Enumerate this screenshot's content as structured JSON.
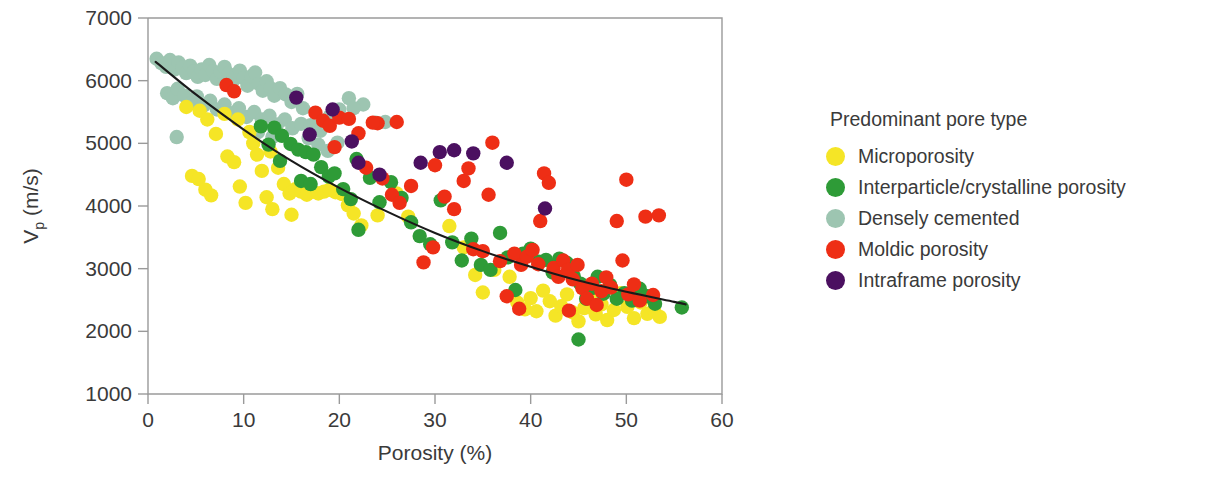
{
  "chart_data": {
    "type": "scatter",
    "title": "",
    "xlabel": "Porosity (%)",
    "ylabel": "Vp (m/s)",
    "ylabel_base": "V",
    "ylabel_sub": "p",
    "ylabel_unit": " (m/s)",
    "xlim": [
      0,
      60
    ],
    "ylim": [
      1000,
      7000
    ],
    "xticks": [
      0,
      10,
      20,
      30,
      40,
      50,
      60
    ],
    "yticks": [
      1000,
      2000,
      3000,
      4000,
      5000,
      6000,
      7000
    ],
    "xtick_labels": [
      "0",
      "10",
      "20",
      "30",
      "40",
      "50",
      "60"
    ],
    "ytick_labels": [
      "1000",
      "2000",
      "3000",
      "4000",
      "5000",
      "6000",
      "7000"
    ],
    "grid": false,
    "legend_position": "right",
    "legend_title": "Predominant pore type",
    "marker_radius": 7.2,
    "series": [
      {
        "name": "Microporosity",
        "color": "#F5E526",
        "points": [
          [
            4.0,
            5580
          ],
          [
            5.4,
            5520
          ],
          [
            6.2,
            5380
          ],
          [
            7.1,
            5150
          ],
          [
            4.6,
            4480
          ],
          [
            5.3,
            4430
          ],
          [
            6.0,
            4260
          ],
          [
            6.6,
            4170
          ],
          [
            8.3,
            4790
          ],
          [
            9.0,
            4700
          ],
          [
            9.6,
            4310
          ],
          [
            10.2,
            4050
          ],
          [
            11.0,
            5000
          ],
          [
            11.4,
            4820
          ],
          [
            11.9,
            4560
          ],
          [
            12.4,
            4140
          ],
          [
            13.0,
            3950
          ],
          [
            13.6,
            4610
          ],
          [
            14.2,
            4350
          ],
          [
            14.8,
            4200
          ],
          [
            15.4,
            4270
          ],
          [
            16.0,
            4230
          ],
          [
            16.6,
            4180
          ],
          [
            17.2,
            4230
          ],
          [
            17.8,
            4200
          ],
          [
            18.4,
            4230
          ],
          [
            19.0,
            4260
          ],
          [
            19.6,
            4220
          ],
          [
            20.3,
            4190
          ],
          [
            20.9,
            4010
          ],
          [
            21.5,
            3880
          ],
          [
            15.0,
            3860
          ],
          [
            12.8,
            4870
          ],
          [
            10.6,
            5180
          ],
          [
            9.4,
            5380
          ],
          [
            8.0,
            5470
          ],
          [
            22.3,
            3690
          ],
          [
            24.0,
            3850
          ],
          [
            26.0,
            4200
          ],
          [
            27.2,
            3830
          ],
          [
            31.5,
            3680
          ],
          [
            33.0,
            3340
          ],
          [
            36.2,
            2980
          ],
          [
            37.8,
            2870
          ],
          [
            38.6,
            2460
          ],
          [
            39.4,
            2350
          ],
          [
            40.0,
            2530
          ],
          [
            40.6,
            2320
          ],
          [
            41.3,
            2650
          ],
          [
            42.0,
            2480
          ],
          [
            42.6,
            2250
          ],
          [
            43.2,
            2400
          ],
          [
            43.8,
            2590
          ],
          [
            44.4,
            2300
          ],
          [
            45.0,
            2160
          ],
          [
            45.6,
            2370
          ],
          [
            46.2,
            2520
          ],
          [
            46.8,
            2270
          ],
          [
            47.4,
            2430
          ],
          [
            48.0,
            2180
          ],
          [
            48.7,
            2340
          ],
          [
            49.4,
            2610
          ],
          [
            50.1,
            2390
          ],
          [
            50.8,
            2210
          ],
          [
            51.5,
            2460
          ],
          [
            52.2,
            2280
          ],
          [
            52.9,
            2340
          ],
          [
            53.5,
            2230
          ],
          [
            35.0,
            2620
          ],
          [
            34.2,
            2900
          ]
        ]
      },
      {
        "name": "Interparticle/crystalline porosity",
        "color": "#2E9B37",
        "points": [
          [
            13.2,
            5250
          ],
          [
            14.0,
            5120
          ],
          [
            14.9,
            4990
          ],
          [
            15.7,
            4900
          ],
          [
            16.5,
            4860
          ],
          [
            17.3,
            4820
          ],
          [
            18.1,
            4620
          ],
          [
            18.9,
            4470
          ],
          [
            12.6,
            4980
          ],
          [
            13.8,
            4720
          ],
          [
            16.0,
            4400
          ],
          [
            17.0,
            4350
          ],
          [
            19.5,
            4520
          ],
          [
            20.4,
            4270
          ],
          [
            21.2,
            4110
          ],
          [
            22.0,
            3620
          ],
          [
            24.2,
            4060
          ],
          [
            25.4,
            4380
          ],
          [
            26.5,
            4130
          ],
          [
            27.5,
            3740
          ],
          [
            28.4,
            3520
          ],
          [
            29.5,
            3390
          ],
          [
            30.6,
            4090
          ],
          [
            31.8,
            3420
          ],
          [
            32.8,
            3130
          ],
          [
            33.8,
            3480
          ],
          [
            34.8,
            3060
          ],
          [
            35.8,
            2980
          ],
          [
            36.8,
            3570
          ],
          [
            37.6,
            3180
          ],
          [
            38.4,
            2660
          ],
          [
            39.2,
            3240
          ],
          [
            40.0,
            3320
          ],
          [
            40.8,
            3110
          ],
          [
            41.6,
            3140
          ],
          [
            42.3,
            2940
          ],
          [
            43.0,
            3160
          ],
          [
            43.8,
            3090
          ],
          [
            44.5,
            2880
          ],
          [
            45.2,
            2760
          ],
          [
            45.8,
            2520
          ],
          [
            46.4,
            2690
          ],
          [
            47.0,
            2870
          ],
          [
            47.6,
            2600
          ],
          [
            48.3,
            2740
          ],
          [
            49.0,
            2520
          ],
          [
            49.8,
            2610
          ],
          [
            50.6,
            2490
          ],
          [
            51.4,
            2680
          ],
          [
            52.2,
            2560
          ],
          [
            53.0,
            2440
          ],
          [
            55.8,
            2380
          ],
          [
            45.0,
            1870
          ],
          [
            23.2,
            4450
          ],
          [
            21.8,
            4750
          ],
          [
            11.8,
            5270
          ]
        ]
      },
      {
        "name": "Densely cemented",
        "color": "#9DC5B1",
        "points": [
          [
            0.9,
            6350
          ],
          [
            1.4,
            6280
          ],
          [
            1.9,
            6220
          ],
          [
            2.3,
            6330
          ],
          [
            2.8,
            6180
          ],
          [
            3.2,
            6290
          ],
          [
            3.6,
            6210
          ],
          [
            4.0,
            6120
          ],
          [
            4.4,
            6240
          ],
          [
            4.8,
            6150
          ],
          [
            5.2,
            6060
          ],
          [
            5.6,
            6180
          ],
          [
            6.0,
            6090
          ],
          [
            6.4,
            6250
          ],
          [
            6.8,
            6150
          ],
          [
            7.2,
            6030
          ],
          [
            7.6,
            6140
          ],
          [
            8.0,
            6220
          ],
          [
            8.4,
            6110
          ],
          [
            8.8,
            5980
          ],
          [
            9.2,
            6090
          ],
          [
            9.6,
            6160
          ],
          [
            10.0,
            6040
          ],
          [
            10.4,
            5920
          ],
          [
            10.8,
            6070
          ],
          [
            11.2,
            6130
          ],
          [
            11.6,
            5950
          ],
          [
            12.0,
            5840
          ],
          [
            12.4,
            5990
          ],
          [
            12.8,
            5880
          ],
          [
            13.2,
            5760
          ],
          [
            13.8,
            5880
          ],
          [
            14.4,
            5780
          ],
          [
            15.0,
            5660
          ],
          [
            15.6,
            5790
          ],
          [
            16.2,
            5560
          ],
          [
            2.0,
            5800
          ],
          [
            2.6,
            5720
          ],
          [
            3.1,
            5870
          ],
          [
            3.8,
            5760
          ],
          [
            4.5,
            5640
          ],
          [
            5.1,
            5750
          ],
          [
            5.8,
            5600
          ],
          [
            6.5,
            5680
          ],
          [
            7.2,
            5540
          ],
          [
            8.0,
            5620
          ],
          [
            8.8,
            5480
          ],
          [
            9.5,
            5560
          ],
          [
            10.3,
            5420
          ],
          [
            11.1,
            5500
          ],
          [
            11.9,
            5380
          ],
          [
            12.7,
            5440
          ],
          [
            13.5,
            5300
          ],
          [
            14.3,
            5380
          ],
          [
            15.1,
            5240
          ],
          [
            16.0,
            5310
          ],
          [
            17.0,
            5290
          ],
          [
            18.0,
            5200
          ],
          [
            19.0,
            5430
          ],
          [
            20.0,
            5540
          ],
          [
            21.0,
            5720
          ],
          [
            22.5,
            5620
          ],
          [
            23.8,
            5330
          ],
          [
            24.8,
            5340
          ],
          [
            3.0,
            5100
          ],
          [
            17.8,
            4980
          ],
          [
            18.8,
            4880
          ],
          [
            16.8,
            5080
          ],
          [
            19.8,
            5010
          ],
          [
            13.0,
            5100
          ],
          [
            11.5,
            5180
          ],
          [
            21.5,
            5560
          ]
        ]
      },
      {
        "name": "Moldic porosity",
        "color": "#EE2E15",
        "points": [
          [
            8.2,
            5930
          ],
          [
            9.0,
            5830
          ],
          [
            17.5,
            5490
          ],
          [
            18.3,
            5360
          ],
          [
            19.0,
            5280
          ],
          [
            20.0,
            5410
          ],
          [
            21.0,
            5390
          ],
          [
            22.0,
            5160
          ],
          [
            24.0,
            5320
          ],
          [
            19.5,
            4940
          ],
          [
            22.8,
            4610
          ],
          [
            24.5,
            4440
          ],
          [
            25.5,
            4180
          ],
          [
            26.3,
            4050
          ],
          [
            27.5,
            4320
          ],
          [
            28.8,
            3100
          ],
          [
            30.0,
            4650
          ],
          [
            31.0,
            4150
          ],
          [
            32.0,
            3950
          ],
          [
            33.0,
            4400
          ],
          [
            34.0,
            3310
          ],
          [
            35.0,
            3280
          ],
          [
            36.0,
            5010
          ],
          [
            36.8,
            3120
          ],
          [
            37.5,
            2560
          ],
          [
            38.3,
            3240
          ],
          [
            39.0,
            3060
          ],
          [
            39.6,
            3190
          ],
          [
            40.2,
            3300
          ],
          [
            40.8,
            3070
          ],
          [
            41.4,
            4520
          ],
          [
            41.9,
            4370
          ],
          [
            42.4,
            3010
          ],
          [
            42.9,
            2870
          ],
          [
            43.4,
            3130
          ],
          [
            43.9,
            2980
          ],
          [
            44.4,
            2830
          ],
          [
            44.9,
            3060
          ],
          [
            45.4,
            2690
          ],
          [
            45.9,
            2520
          ],
          [
            46.4,
            2760
          ],
          [
            46.9,
            2420
          ],
          [
            47.4,
            2640
          ],
          [
            47.9,
            2860
          ],
          [
            48.4,
            2700
          ],
          [
            49.0,
            3760
          ],
          [
            49.6,
            3130
          ],
          [
            50.2,
            2590
          ],
          [
            50.8,
            2750
          ],
          [
            51.4,
            2490
          ],
          [
            52.0,
            3830
          ],
          [
            52.8,
            2580
          ],
          [
            53.4,
            3850
          ],
          [
            50.0,
            4420
          ],
          [
            41.0,
            3760
          ],
          [
            35.6,
            4180
          ],
          [
            29.8,
            3340
          ],
          [
            26.0,
            5340
          ],
          [
            23.5,
            5330
          ],
          [
            33.5,
            4600
          ],
          [
            38.8,
            2360
          ],
          [
            44.0,
            2330
          ]
        ]
      },
      {
        "name": "Intraframe porosity",
        "color": "#4B1060",
        "points": [
          [
            15.5,
            5730
          ],
          [
            19.3,
            5540
          ],
          [
            16.9,
            5140
          ],
          [
            21.3,
            5030
          ],
          [
            22.0,
            4690
          ],
          [
            24.2,
            4500
          ],
          [
            30.5,
            4860
          ],
          [
            32.0,
            4890
          ],
          [
            34.0,
            4840
          ],
          [
            28.5,
            4690
          ],
          [
            41.5,
            3960
          ],
          [
            37.5,
            4690
          ]
        ]
      }
    ],
    "fit_curve": {
      "description": "black best-fit trend line",
      "color": "#1a1a1a",
      "points": [
        [
          0.8,
          6300
        ],
        [
          5,
          5780
        ],
        [
          10,
          5220
        ],
        [
          15,
          4720
        ],
        [
          20,
          4290
        ],
        [
          25,
          3910
        ],
        [
          30,
          3570
        ],
        [
          35,
          3280
        ],
        [
          40,
          3030
        ],
        [
          45,
          2810
        ],
        [
          50,
          2630
        ],
        [
          55,
          2470
        ],
        [
          56.2,
          2430
        ]
      ]
    }
  },
  "legend": {
    "title": "Predominant pore type",
    "items": [
      {
        "label": "Microporosity",
        "color": "#F5E526"
      },
      {
        "label": "Interparticle/crystalline porosity",
        "color": "#2E9B37"
      },
      {
        "label": "Densely cemented",
        "color": "#9DC5B1"
      },
      {
        "label": "Moldic porosity",
        "color": "#EE2E15"
      },
      {
        "label": "Intraframe porosity",
        "color": "#4B1060"
      }
    ]
  }
}
